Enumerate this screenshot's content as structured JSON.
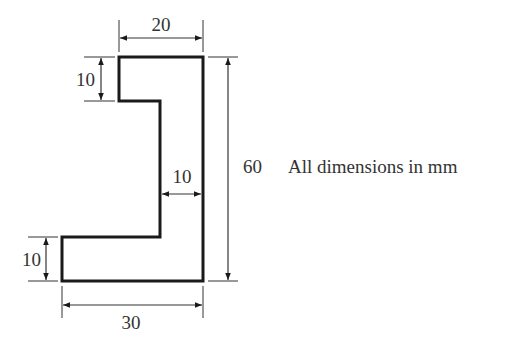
{
  "diagram": {
    "type": "engineering-cross-section",
    "shape": "stepped-L-profile",
    "note": "All dimensions in mm",
    "dimensions": {
      "top_width": "20",
      "top_notch_height": "10",
      "web_thickness": "10",
      "overall_height": "60",
      "bottom_flange_height": "10",
      "bottom_width": "30"
    },
    "colors": {
      "outline": "#1a1a1a",
      "dimension_lines": "#333333",
      "text": "#333333",
      "background": "#ffffff"
    }
  }
}
